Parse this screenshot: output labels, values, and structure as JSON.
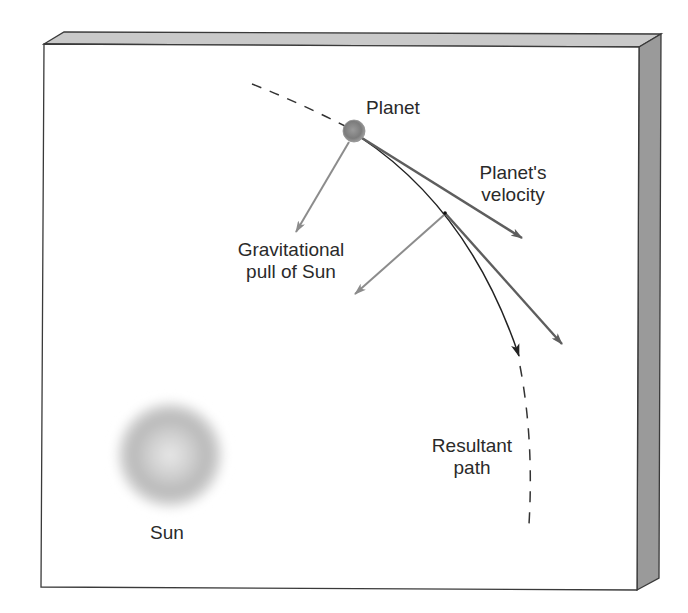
{
  "diagram": {
    "type": "orbital-mechanics-illustration",
    "colors": {
      "panel_face": "#ffffff",
      "panel_top": "#c9c9c9",
      "panel_side": "#9a9a9a",
      "panel_outline": "#3a3a3a",
      "velocity_arrow": "#666666",
      "gravity_arrow": "#8c8c8c",
      "path_line": "#222222",
      "planet": "#8a8a8a",
      "sun_edge": "#b0b0b0",
      "sun_center": "#e6e6e6"
    },
    "labels": {
      "planet": "Planet",
      "velocity_line1": "Planet's",
      "velocity_line2": "velocity",
      "gravity_line1": "Gravitational",
      "gravity_line2": "pull of Sun",
      "path_line1": "Resultant",
      "path_line2": "path",
      "sun": "Sun"
    }
  }
}
